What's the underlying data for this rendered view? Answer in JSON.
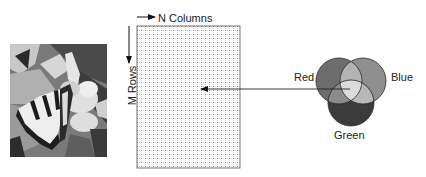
{
  "photo": {
    "description": "grayscale photo of a swallowtail butterfly on white flowers"
  },
  "pixel_grid": {
    "columns_label": "N Columns",
    "rows_label": "M Rows",
    "grid_left": 137,
    "grid_top": 26,
    "grid_right": 240,
    "grid_bottom": 168,
    "cell_size": 4
  },
  "color_model": {
    "labels": {
      "red": "Red",
      "blue": "Blue",
      "green": "Green"
    },
    "colors": {
      "red_only": "#6d6d6d",
      "blue_only": "#8f8f8f",
      "green_only": "#3b3b3b",
      "red_blue": "#b3b3b3",
      "red_green": "#8b8b8b",
      "blue_green": "#b8b8b8",
      "all_three": "#dcdcdc"
    }
  },
  "pointer_arrow": {
    "from": [
      326,
      89
    ],
    "to": [
      200,
      89
    ]
  }
}
